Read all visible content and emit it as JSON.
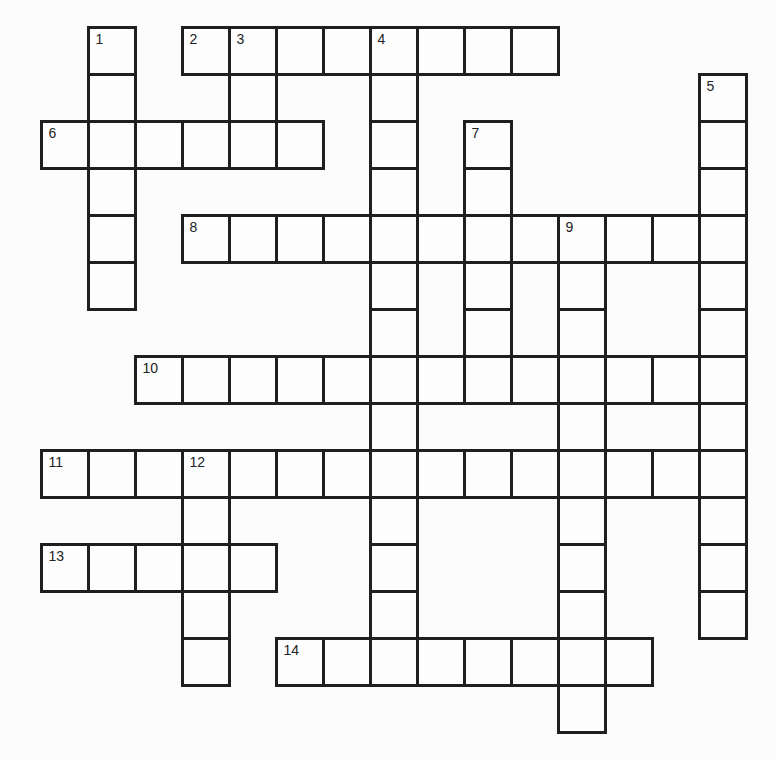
{
  "puzzle": {
    "grid": {
      "origin_x": 41,
      "origin_y": 27,
      "cell_size": 47,
      "rows": 15,
      "cols": 15,
      "line_color": "#1f1f1f",
      "cell_color": "#fdfdfd",
      "background": "#fcfcfc"
    },
    "entries": [
      {
        "number": "1",
        "direction": "down",
        "row": 0,
        "col": 1,
        "length": 6
      },
      {
        "number": "2",
        "direction": "across",
        "row": 0,
        "col": 3,
        "length": 8
      },
      {
        "number": "3",
        "direction": "down",
        "row": 0,
        "col": 4,
        "length": 3
      },
      {
        "number": "4",
        "direction": "down",
        "row": 0,
        "col": 7,
        "length": 14
      },
      {
        "number": "5",
        "direction": "down",
        "row": 1,
        "col": 14,
        "length": 12
      },
      {
        "number": "6",
        "direction": "across",
        "row": 2,
        "col": 0,
        "length": 6
      },
      {
        "number": "7",
        "direction": "down",
        "row": 2,
        "col": 9,
        "length": 6
      },
      {
        "number": "8",
        "direction": "across",
        "row": 4,
        "col": 3,
        "length": 12
      },
      {
        "number": "9",
        "direction": "down",
        "row": 4,
        "col": 11,
        "length": 11
      },
      {
        "number": "10",
        "direction": "across",
        "row": 7,
        "col": 2,
        "length": 13
      },
      {
        "number": "11",
        "direction": "across",
        "row": 9,
        "col": 0,
        "length": 14
      },
      {
        "number": "12",
        "direction": "down",
        "row": 9,
        "col": 3,
        "length": 5
      },
      {
        "number": "13",
        "direction": "across",
        "row": 11,
        "col": 0,
        "length": 5
      },
      {
        "number": "14",
        "direction": "across",
        "row": 13,
        "col": 5,
        "length": 8
      }
    ]
  }
}
